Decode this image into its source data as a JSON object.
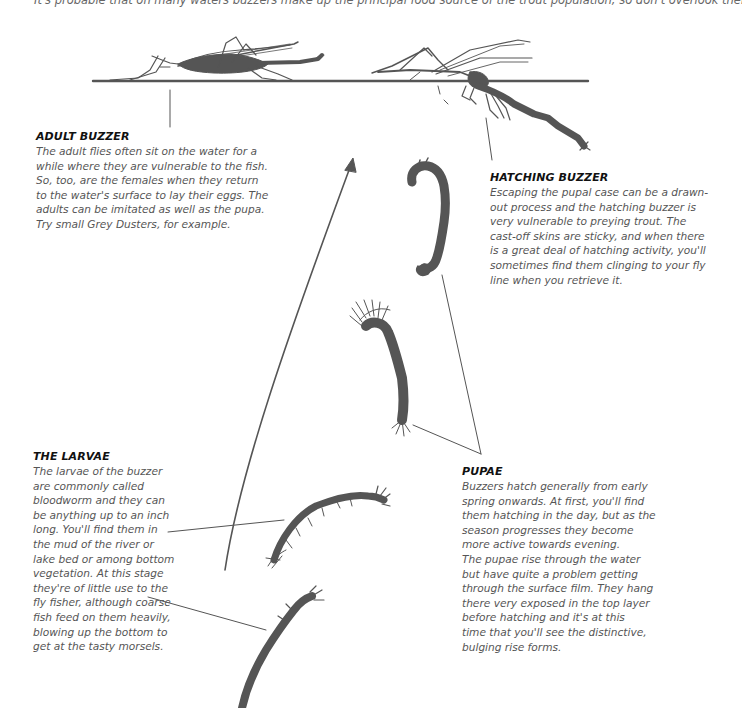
{
  "intro": {
    "text": "It's probable that on many waters buzzers make up the principal food source of the trout population, so don't overlook them."
  },
  "sections": {
    "adult": {
      "title": "ADULT BUZZER",
      "lines": [
        "The adult flies often sit on the water for a",
        "while where they are vulnerable to the fish.",
        "So, too, are the females when they return",
        "to the water's surface to lay their eggs. The",
        "adults can be imitated as well as the pupa.",
        "Try small Grey Dusters, for example."
      ]
    },
    "hatching": {
      "title": "HATCHING BUZZER",
      "lines": [
        "Escaping the pupal case can be a drawn-",
        "out process and the hatching buzzer is",
        "very vulnerable to preying trout. The",
        "cast-off skins are sticky, and when there",
        "is a great deal of hatching activity, you'll",
        "sometimes find them clinging to your fly",
        "line when you retrieve it."
      ]
    },
    "larvae": {
      "title": "THE LARVAE",
      "lines": [
        "The larvae of the buzzer",
        "are commonly called",
        "bloodworm and they can",
        "be anything up to an inch",
        "long. You'll find them in",
        "the mud of the river or",
        "lake bed or among bottom",
        "vegetation. At this stage",
        "they're of little use to the",
        "fly fisher, although coarse",
        "fish feed on them heavily,",
        "blowing up the bottom to",
        "get at the tasty morsels."
      ]
    },
    "pupae": {
      "title": "PUPAE",
      "lines": [
        "Buzzers hatch generally from early",
        "spring onwards. At first, you'll find",
        "them hatching in the day, but as the",
        "season progresses they become",
        "more active towards evening.",
        "The pupae rise through the water",
        "but have quite a problem getting",
        "through the surface film. They hang",
        "there very exposed in the top layer",
        "before hatching and it's at this",
        "time that you'll see the distinctive,",
        "bulging rise forms."
      ]
    }
  },
  "illustration": {
    "ink_color": "#555555",
    "figures": [
      "adult-buzzer",
      "hatching-buzzer",
      "pupa-upper",
      "pupa-lower",
      "larva-upper",
      "larva-lower"
    ],
    "arrow": "upward-life-cycle-arrow"
  }
}
